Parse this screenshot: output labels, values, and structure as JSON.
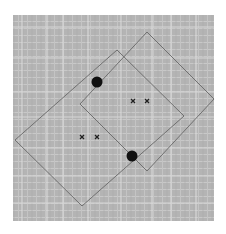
{
  "figure": {
    "background_color": "#b4b4b4",
    "grid_line_color": "#d2d2d2",
    "outline_color": "#6e6e6e",
    "dot_color": "#111111",
    "cross_color": "#222222"
  },
  "shapes": {
    "rectangles": [
      {
        "name": "upper-right-rectangle"
      },
      {
        "name": "lower-left-rectangle"
      }
    ],
    "dots": [
      {
        "name": "upper-dot"
      },
      {
        "name": "lower-dot"
      }
    ],
    "cross_pairs": [
      {
        "name": "upper-cross-pair",
        "count": 2
      },
      {
        "name": "lower-cross-pair",
        "count": 2
      }
    ]
  }
}
